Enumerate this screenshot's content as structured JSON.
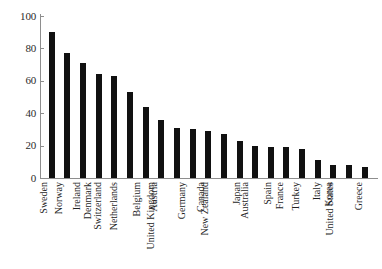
{
  "chart_data": {
    "type": "bar",
    "title": "",
    "subtitle": "",
    "xlabel": "",
    "ylabel": "",
    "ylim": [
      0,
      100
    ],
    "yticks": [
      0,
      20,
      40,
      60,
      80,
      100
    ],
    "grid": false,
    "legend": null,
    "bar_color": "#111111",
    "axis_color": "#8e8e8e",
    "categories": [
      "Sweden",
      "Norway",
      "Ireland",
      "Denmark",
      "Switzerland",
      "Netherlands",
      "Belgium",
      "Austria",
      "United Kingdom",
      "Germany",
      "Canada",
      "New Zealand",
      "Japan",
      "Australia",
      "Spain",
      "France",
      "Turkey",
      "Italy",
      "Korea",
      "United States",
      "Greece"
    ],
    "values": [
      90,
      77,
      71,
      64,
      63,
      53,
      44,
      36,
      31,
      30,
      29,
      27,
      23,
      20,
      19,
      19,
      18,
      11,
      8,
      8,
      7
    ]
  }
}
